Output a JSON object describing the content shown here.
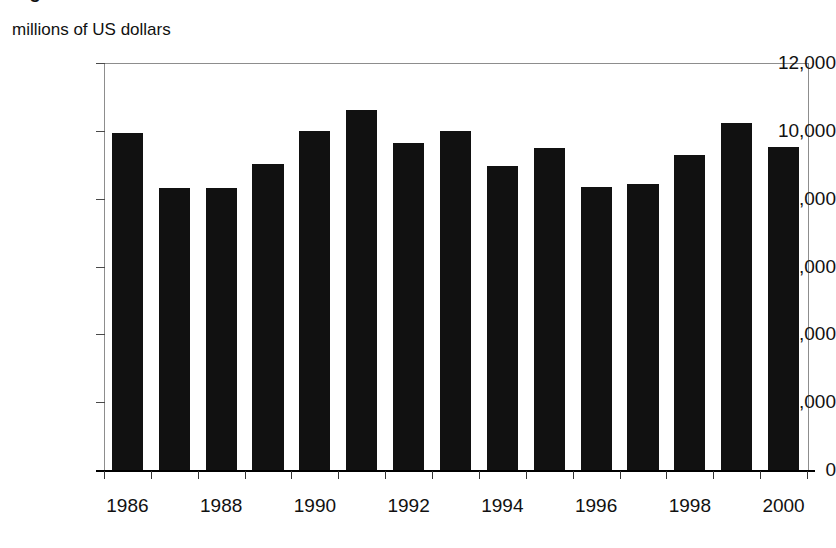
{
  "figure": {
    "title_cropped": "Figure: merchandise trade",
    "axis_caption": "millions of US dollars"
  },
  "chart_data": {
    "type": "bar",
    "title": "",
    "subtitle": "",
    "xlabel": "",
    "ylabel": "millions of US dollars",
    "ylim": [
      0,
      12000
    ],
    "ytick_values": [
      0,
      2000,
      4000,
      6000,
      8000,
      10000,
      12000
    ],
    "ytick_labels": [
      "0",
      "2,000",
      "4,000",
      "6,000",
      "8,000",
      "10,000",
      "12,000"
    ],
    "grid": false,
    "legend": "none",
    "bar_color": "#111111",
    "axis_color": "#8d8d8d",
    "categories": [
      "1986",
      "1987",
      "1988",
      "1989",
      "1990",
      "1991",
      "1992",
      "1993",
      "1994",
      "1995",
      "1996",
      "1997",
      "1998",
      "1999",
      "2000"
    ],
    "xtick_labels_shown": [
      "1986",
      "1988",
      "1990",
      "1992",
      "1994",
      "1996",
      "1998",
      "2000"
    ],
    "values": [
      9930,
      8320,
      8320,
      9010,
      9990,
      10620,
      9630,
      10000,
      8950,
      9490,
      8340,
      8440,
      9280,
      10220,
      9530
    ],
    "series": [
      {
        "name": "value",
        "values": [
          9930,
          8320,
          8320,
          9010,
          9990,
          10620,
          9630,
          10000,
          8950,
          9490,
          8340,
          8440,
          9280,
          10220,
          9530
        ]
      }
    ]
  }
}
